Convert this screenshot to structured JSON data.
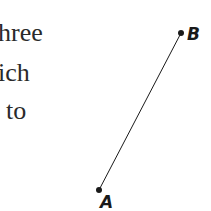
{
  "text_fragment": {
    "lines": [
      "hree",
      "ich",
      "to"
    ]
  },
  "figure": {
    "segment": {
      "point_a": {
        "label": "A",
        "x": 99,
        "y": 190
      },
      "point_b": {
        "label": "B",
        "x": 181,
        "y": 33
      }
    },
    "color": "#1a1a1a"
  }
}
